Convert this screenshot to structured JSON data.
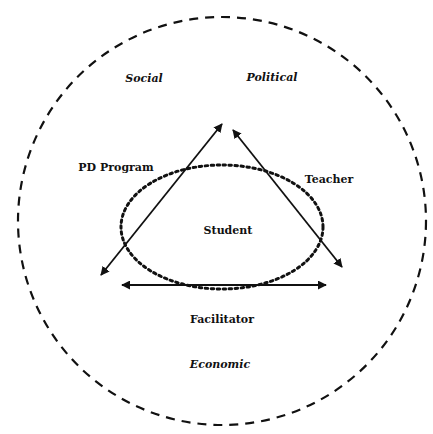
{
  "diagram": {
    "context_labels": {
      "social": "Social",
      "political": "Political",
      "economic": "Economic"
    },
    "node_labels": {
      "pd_program": "PD Program",
      "teacher": "Teacher",
      "student": "Student",
      "facilitator": "Facilitator"
    },
    "colors": {
      "stroke": "#111111",
      "background": "#ffffff"
    }
  }
}
